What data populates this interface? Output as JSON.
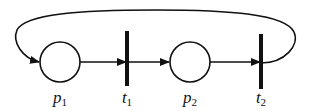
{
  "diagram": {
    "type": "petri-net",
    "colors": {
      "stroke": "#111111",
      "background": "#ffffff"
    },
    "places": [
      {
        "id": "p1",
        "base": "p",
        "sub": "1",
        "cx": 60,
        "cy": 62,
        "r": 20
      },
      {
        "id": "p2",
        "base": "p",
        "sub": "2",
        "cx": 190,
        "cy": 62,
        "r": 20
      }
    ],
    "transitions": [
      {
        "id": "t1",
        "base": "t",
        "sub": "1",
        "x": 127,
        "y1": 31,
        "y2": 86
      },
      {
        "id": "t2",
        "base": "t",
        "sub": "2",
        "x": 261,
        "y1": 34,
        "y2": 89
      }
    ],
    "arcs": [
      {
        "from": "p1",
        "to": "t1"
      },
      {
        "from": "t1",
        "to": "p2"
      },
      {
        "from": "p2",
        "to": "t2"
      },
      {
        "from": "t2",
        "to": "p1",
        "style": "curved-feedback-over-top"
      }
    ],
    "labels": {
      "p1": {
        "base": "p",
        "sub": "1"
      },
      "t1": {
        "base": "t",
        "sub": "1"
      },
      "p2": {
        "base": "p",
        "sub": "2"
      },
      "t2": {
        "base": "t",
        "sub": "2"
      }
    }
  }
}
